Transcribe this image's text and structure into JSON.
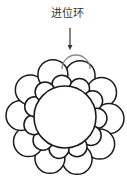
{
  "diagram": {
    "label": "进位环",
    "colors": {
      "stroke": "#1a1a1a",
      "advanced_stroke": "#8a8a8a",
      "fill": "#ffffff",
      "arrow": "#333333"
    },
    "arrow": {
      "x": 70,
      "y1": 28,
      "y2": 50
    },
    "center_circle": {
      "cx": 65,
      "cy": 117,
      "r": 31
    },
    "advanced_circle": {
      "cx": 76,
      "cy": 69,
      "r": 14
    },
    "outer_ring": {
      "count": 10,
      "orbit": 44,
      "r": 15
    },
    "inner_ring": {
      "count": 11,
      "orbit": 32,
      "r": 10
    }
  }
}
